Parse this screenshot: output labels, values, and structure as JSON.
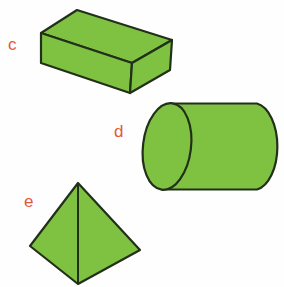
{
  "figure": {
    "background": "#fefefe"
  },
  "colors": {
    "shape_fill": "#7fc242",
    "shape_outline": "#22301a",
    "label": "#e2573a"
  },
  "shapes": [
    {
      "label": "c",
      "name": "rectangular-prism"
    },
    {
      "label": "d",
      "name": "cylinder"
    },
    {
      "label": "e",
      "name": "pyramid"
    }
  ]
}
